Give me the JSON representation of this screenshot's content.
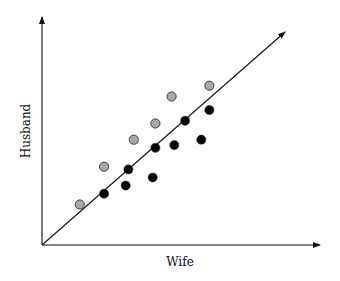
{
  "chart_data": {
    "type": "scatter",
    "title": "",
    "xlabel": "Wife",
    "ylabel": "Husband",
    "grid": false,
    "legend": null,
    "ticks": {
      "x": [],
      "y": []
    },
    "reference_line": {
      "label": "",
      "description": "45-degree line (Husband = Wife)",
      "arrowed": true
    },
    "series": [
      {
        "name": "gray points (above line)",
        "color": "#a8a8a8",
        "points": [
          {
            "x": 1.4,
            "y": 1.5
          },
          {
            "x": 2.3,
            "y": 2.9
          },
          {
            "x": 3.4,
            "y": 3.9
          },
          {
            "x": 4.2,
            "y": 4.5
          },
          {
            "x": 4.8,
            "y": 5.5
          },
          {
            "x": 6.2,
            "y": 5.9
          }
        ]
      },
      {
        "name": "black points (on/below line)",
        "color": "#000000",
        "points": [
          {
            "x": 2.3,
            "y": 1.9
          },
          {
            "x": 3.1,
            "y": 2.2
          },
          {
            "x": 3.2,
            "y": 2.8
          },
          {
            "x": 4.1,
            "y": 2.5
          },
          {
            "x": 4.2,
            "y": 3.6
          },
          {
            "x": 4.9,
            "y": 3.7
          },
          {
            "x": 5.3,
            "y": 4.6
          },
          {
            "x": 5.9,
            "y": 3.9
          },
          {
            "x": 6.2,
            "y": 5.0
          }
        ]
      }
    ],
    "xlim": [
      0,
      10.3
    ],
    "ylim": [
      0,
      8.4
    ]
  },
  "pixel_layout": {
    "origin": [
      42,
      245
    ],
    "x_end": 320,
    "y_end": 17,
    "diag_end": [
      285,
      32
    ],
    "x_scale": 27.0,
    "y_scale": 27.0
  },
  "labels": {
    "x_axis": "Wife",
    "y_axis": "Husband"
  }
}
